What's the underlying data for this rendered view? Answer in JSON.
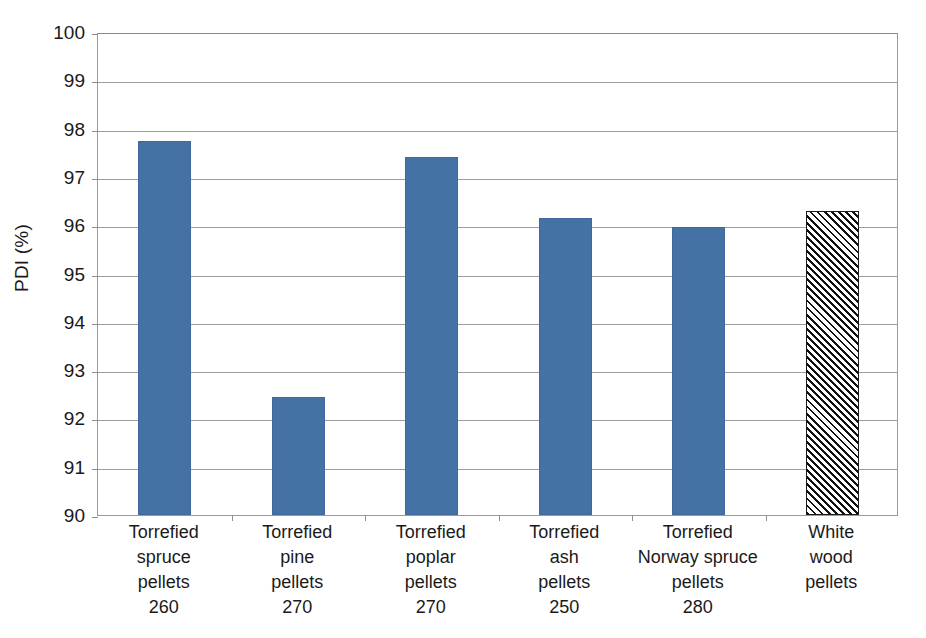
{
  "chart_data": {
    "type": "bar",
    "title": "",
    "xlabel": "",
    "ylabel": "PDI (%)",
    "ylim": [
      90,
      100
    ],
    "ytick_step": 1,
    "grid": true,
    "legend": "none",
    "yticks": [
      "100",
      "99",
      "98",
      "97",
      "96",
      "95",
      "94",
      "93",
      "92",
      "91",
      "90"
    ],
    "categories": [
      "Torrefied spruce pellets 260",
      "Torrefied pine pellets 270",
      "Torrefied poplar pellets 270",
      "Torrefied ash pellets 250",
      "Torrefied Norway spruce pellets 280",
      "White wood pellets"
    ],
    "category_lines": [
      [
        "Torrefied",
        "spruce",
        "pellets",
        "260"
      ],
      [
        "Torrefied",
        "pine",
        "pellets",
        "270"
      ],
      [
        "Torrefied",
        "poplar",
        "pellets",
        "270"
      ],
      [
        "Torrefied",
        "ash",
        "pellets",
        "250"
      ],
      [
        "Torrefied",
        "Norway spruce",
        "pellets",
        "280"
      ],
      [
        "White",
        "wood",
        "pellets"
      ]
    ],
    "values": [
      97.75,
      92.45,
      97.42,
      96.15,
      95.97,
      96.3
    ],
    "bar_styles": [
      "solid",
      "solid",
      "solid",
      "solid",
      "solid",
      "hatched"
    ],
    "colors": {
      "bar_fill": "#4472a4",
      "bar_border": "#40699b",
      "hatch_line": "#111111",
      "hatch_background": "#ffffff",
      "gridline": "#9d9d9d",
      "axis": "#8d8d8d",
      "text": "#1a1a1a",
      "background": "#ffffff"
    }
  }
}
